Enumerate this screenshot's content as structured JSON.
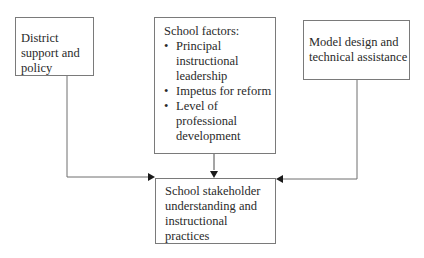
{
  "diagram": {
    "nodes": {
      "district": {
        "label": "District support and policy"
      },
      "school_factors": {
        "title": "School factors:",
        "items": [
          "Principal instructional leadership",
          "Impetus for reform",
          "Level of professional development"
        ]
      },
      "model_design": {
        "label": "Model design and technical assistance"
      },
      "outcome": {
        "label": "School stakeholder understanding and instructional practices"
      }
    },
    "edges": [
      {
        "from": "district",
        "to": "outcome"
      },
      {
        "from": "school_factors",
        "to": "outcome"
      },
      {
        "from": "model_design",
        "to": "outcome"
      }
    ],
    "colors": {
      "line": "#6e6e6e",
      "arrow": "#1a1a1a",
      "border": "#7a7a7a"
    }
  }
}
